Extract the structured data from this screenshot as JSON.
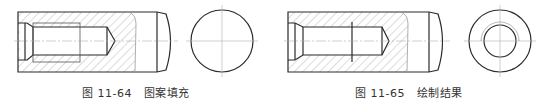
{
  "figures": [
    {
      "id": "fig-11-64",
      "caption_number": "图 11-64",
      "caption_title": "图案填充",
      "end_view": "solid-circle"
    },
    {
      "id": "fig-11-65",
      "caption_number": "图 11-65",
      "caption_title": "绘制结果",
      "end_view": "ring-with-thread"
    }
  ],
  "colors": {
    "line": "#2a2a2a",
    "hatch": "#9a9a9a",
    "centerline": "#b0b0b0",
    "text": "#333333"
  }
}
